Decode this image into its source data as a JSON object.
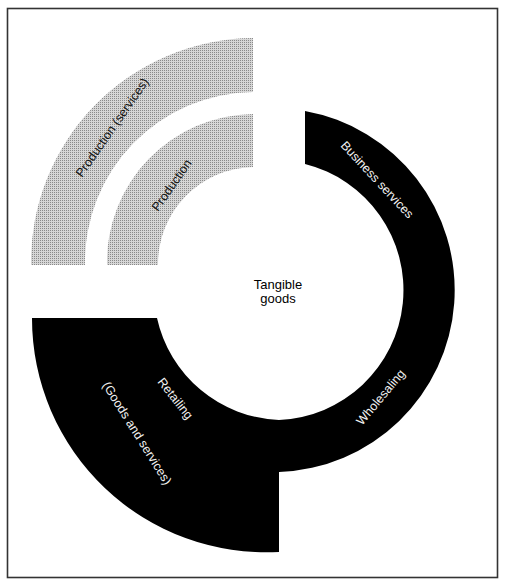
{
  "diagram": {
    "center_label": {
      "line1": "Tangible",
      "line2": "goods"
    },
    "segments": [
      {
        "id": "production-services",
        "label": "Production (services)",
        "style": "gray-dotted"
      },
      {
        "id": "production",
        "label": "Production",
        "style": "gray-dotted"
      },
      {
        "id": "business-services",
        "label": "Business services",
        "style": "black"
      },
      {
        "id": "wholesaling",
        "label": "Wholesaling",
        "style": "black"
      },
      {
        "id": "retailing",
        "label_line1": "Retailing",
        "label_line2": "(Goods and services)",
        "style": "black"
      }
    ],
    "colors": {
      "black_band": "#000000",
      "gray_band": "#b5b5b5",
      "frame": "#333333",
      "background": "#ffffff"
    }
  }
}
